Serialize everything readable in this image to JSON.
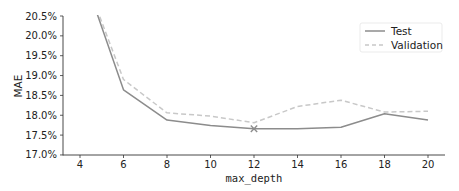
{
  "chart_data": {
    "type": "line",
    "title": "",
    "xlabel": "max_depth",
    "ylabel": "MAE",
    "x": [
      4,
      6,
      8,
      10,
      12,
      14,
      16,
      18,
      20
    ],
    "xticks": [
      4,
      6,
      8,
      10,
      12,
      14,
      16,
      18,
      20
    ],
    "xtick_labels": [
      "4",
      "6",
      "8",
      "10",
      "12",
      "14",
      "16",
      "18",
      "20"
    ],
    "yticks": [
      17.0,
      17.5,
      18.0,
      18.5,
      19.0,
      19.5,
      20.0,
      20.5
    ],
    "ytick_labels": [
      "17.0%",
      "17.5%",
      "18.0%",
      "18.5%",
      "19.0%",
      "19.5%",
      "20.0%",
      "20.5%"
    ],
    "xlim": [
      3.2,
      21
    ],
    "ylim": [
      17.0,
      20.5
    ],
    "grid": false,
    "legend_position": "upper right",
    "series": [
      {
        "name": "Test",
        "style": "solid",
        "color": "#8c8c8c",
        "values": [
          21.8,
          18.64,
          17.88,
          17.74,
          17.66,
          17.66,
          17.7,
          18.04,
          17.88
        ]
      },
      {
        "name": "Validation",
        "style": "dashed",
        "color": "#c8c8c8",
        "values": [
          21.8,
          18.9,
          18.06,
          17.98,
          17.81,
          18.22,
          18.38,
          18.08,
          18.1
        ]
      }
    ],
    "annotations": [
      {
        "type": "marker",
        "shape": "x",
        "x": 12,
        "y": 17.66,
        "label": "best max_depth"
      }
    ]
  },
  "legend": {
    "items": [
      {
        "label": "Test"
      },
      {
        "label": "Validation"
      }
    ]
  }
}
